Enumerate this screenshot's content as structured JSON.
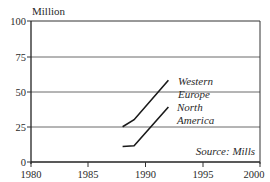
{
  "chart_data": {
    "type": "line",
    "title": "",
    "ylabel": "Million",
    "xlabel": "",
    "xlim": [
      1980,
      2000
    ],
    "ylim": [
      0,
      100
    ],
    "x_ticks": [
      "1980",
      "1985",
      "1990",
      "1995",
      "2000"
    ],
    "y_ticks": [
      "0",
      "25",
      "50",
      "75",
      "100"
    ],
    "grid": "horizontal",
    "legend": "inline labels",
    "series": [
      {
        "name": "Western Europe",
        "label_lines": [
          "Western",
          "Europe"
        ],
        "points": [
          [
            1988,
            25
          ],
          [
            1989,
            30
          ],
          [
            1992,
            58
          ]
        ]
      },
      {
        "name": "North America",
        "label_lines": [
          "North",
          "America"
        ],
        "points": [
          [
            1988,
            11
          ],
          [
            1989,
            11.5
          ],
          [
            1992,
            39
          ]
        ]
      }
    ],
    "annotation": "Source: Mills"
  }
}
